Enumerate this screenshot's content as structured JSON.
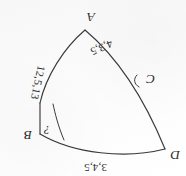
{
  "figure": {
    "kind": "hand-drawn-geometry-diagram",
    "orientation": "upside-down",
    "ink_color": "#2a2a2a",
    "paper_color": "#fcfcfc",
    "vertices": [
      {
        "id": "A",
        "label": "A",
        "x": 100,
        "y": 148
      },
      {
        "id": "B",
        "label": "B",
        "x": 150,
        "y": 47
      },
      {
        "id": "C",
        "label": "C",
        "x": 40,
        "y": 97
      },
      {
        "id": "D",
        "label": "D",
        "x": 17,
        "y": 23
      }
    ],
    "edge_labels": [
      {
        "id": "top",
        "text": "3,4,5"
      },
      {
        "id": "right",
        "text": "12,5,13"
      },
      {
        "id": "bottom",
        "text": "4,3,5"
      }
    ],
    "angle_marks": [
      {
        "id": "at-B",
        "text": "?"
      },
      {
        "id": "at-C",
        "text": ""
      }
    ]
  }
}
